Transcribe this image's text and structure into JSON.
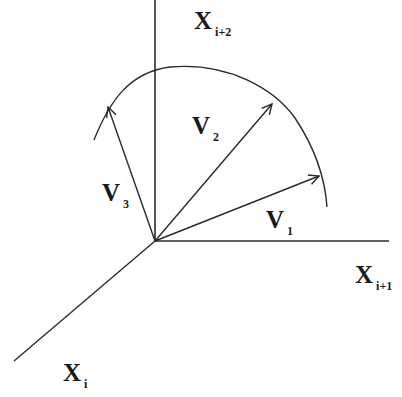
{
  "diagram": {
    "type": "vector-space-axes",
    "colors": {
      "stroke": "#2a2a2a",
      "background": "#ffffff"
    },
    "origin": [
      155,
      241
    ],
    "axes": [
      {
        "id": "x-i-plus-2",
        "label": "X",
        "subscript": "i+2",
        "direction": "up"
      },
      {
        "id": "x-i-plus-1",
        "label": "X",
        "subscript": "i+1",
        "direction": "right"
      },
      {
        "id": "x-i",
        "label": "X",
        "subscript": "i",
        "direction": "down-left"
      }
    ],
    "vectors": [
      {
        "id": "v1",
        "label": "V",
        "subscript": "1"
      },
      {
        "id": "v2",
        "label": "V",
        "subscript": "2"
      },
      {
        "id": "v3",
        "label": "V",
        "subscript": "3"
      }
    ],
    "arc": {
      "description": "circular arc through vector tips"
    }
  }
}
